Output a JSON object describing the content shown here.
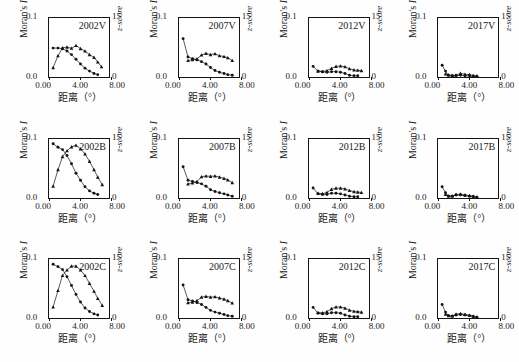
{
  "figure": {
    "title": "",
    "rows": 3,
    "cols": 4
  },
  "axes": {
    "y_left_title": "Moran's I",
    "y_left_title_plain": "Moran's ",
    "y_left_title_italic": "I",
    "y_left_max": "0.1",
    "y_left_min": "0.0",
    "y_right_title": "z-score",
    "y_right_max": "15",
    "y_right_min": "0",
    "x_title": "距离（°）",
    "x_ticks": [
      "0.00",
      "4.00",
      "8.00"
    ],
    "x_min": 0,
    "x_max": 8,
    "y_left_range": [
      0,
      0.1
    ],
    "y_right_range": [
      0,
      15
    ],
    "grid": false,
    "legend": "none",
    "marker_circle": "moran-i-filled-circle",
    "marker_triangle": "z-score-filled-triangle"
  },
  "chart_data": [
    {
      "type": "line",
      "title": "2002V",
      "xlabel": "距离（°）",
      "ylabel": "Moran's I",
      "y2label": "z-score",
      "xlim": [
        0,
        8
      ],
      "ylim": [
        0,
        0.1
      ],
      "y2lim": [
        0,
        15
      ],
      "grid": false,
      "series": [
        {
          "name": "Moran's I",
          "marker": "circle",
          "axis": "left",
          "x": [
            0.55,
            1.2,
            1.8,
            2.4,
            3.0,
            3.6,
            4.2,
            4.8,
            5.4,
            6.0,
            6.5
          ],
          "y": [
            0.049,
            0.049,
            0.048,
            0.044,
            0.038,
            0.03,
            0.022,
            0.015,
            0.01,
            0.006,
            0.004
          ]
        },
        {
          "name": "z-score",
          "marker": "triangle",
          "axis": "right",
          "x": [
            0.55,
            1.2,
            1.8,
            2.4,
            3.0,
            3.6,
            4.2,
            4.8,
            5.4,
            6.0,
            6.5,
            7.0
          ],
          "y": [
            2.4,
            5.4,
            7.4,
            7.6,
            7.3,
            8.0,
            7.2,
            6.6,
            5.7,
            5.0,
            3.8,
            2.6
          ]
        }
      ]
    },
    {
      "type": "line",
      "title": "2007V",
      "xlabel": "距离（°）",
      "ylabel": "Moran's I",
      "y2label": "z-score",
      "xlim": [
        0,
        8
      ],
      "ylim": [
        0,
        0.1
      ],
      "y2lim": [
        0,
        15
      ],
      "grid": false,
      "series": [
        {
          "name": "Moran's I",
          "marker": "circle",
          "axis": "left",
          "x": [
            0.55,
            1.2,
            1.8,
            2.4,
            3.0,
            3.6,
            4.2,
            4.8,
            5.4,
            6.0,
            6.5,
            7.1
          ],
          "y": [
            0.065,
            0.034,
            0.031,
            0.029,
            0.026,
            0.022,
            0.016,
            0.011,
            0.008,
            0.006,
            0.004,
            0.003
          ]
        },
        {
          "name": "z-score",
          "marker": "triangle",
          "axis": "right",
          "x": [
            1.2,
            1.8,
            2.4,
            3.0,
            3.6,
            4.2,
            4.8,
            5.4,
            6.0,
            6.5,
            7.1
          ],
          "y": [
            4.2,
            4.4,
            4.6,
            5.6,
            6.0,
            5.7,
            5.9,
            5.4,
            5.2,
            4.9,
            4.2
          ]
        }
      ]
    },
    {
      "type": "line",
      "title": "2012V",
      "xlabel": "距离（°）",
      "ylabel": "Moran's I",
      "y2label": "z-score",
      "xlim": [
        0,
        8
      ],
      "ylim": [
        0,
        0.1
      ],
      "y2lim": [
        0,
        15
      ],
      "grid": false,
      "series": [
        {
          "name": "Moran's I",
          "marker": "circle",
          "axis": "left",
          "x": [
            0.55,
            1.2,
            1.8,
            2.4,
            3.0,
            3.6,
            4.2,
            4.8,
            5.4,
            6.0,
            6.5
          ],
          "y": [
            0.018,
            0.01,
            0.009,
            0.008,
            0.009,
            0.009,
            0.008,
            0.006,
            0.003,
            0.002,
            0.002
          ]
        },
        {
          "name": "z-score",
          "marker": "triangle",
          "axis": "right",
          "x": [
            1.2,
            1.8,
            2.4,
            3.0,
            3.6,
            4.2,
            4.8,
            5.4,
            6.0,
            6.5,
            7.0
          ],
          "y": [
            1.5,
            1.4,
            1.6,
            2.2,
            2.7,
            2.8,
            2.6,
            2.1,
            1.8,
            1.7,
            1.6
          ]
        }
      ]
    },
    {
      "type": "line",
      "title": "2017V",
      "xlabel": "距离（°）",
      "ylabel": "Moran's I",
      "y2label": "z-score",
      "xlim": [
        0,
        8
      ],
      "ylim": [
        0,
        0.1
      ],
      "y2lim": [
        0,
        15
      ],
      "grid": false,
      "series": [
        {
          "name": "Moran's I",
          "marker": "circle",
          "axis": "left",
          "x": [
            0.55,
            1.0,
            1.4,
            1.9,
            2.4,
            3.0,
            3.6,
            4.2,
            4.7,
            5.2
          ],
          "y": [
            0.02,
            0.01,
            0.003,
            0.002,
            0.002,
            0.003,
            0.002,
            0.002,
            0.001,
            0.001
          ]
        },
        {
          "name": "z-score",
          "marker": "triangle",
          "axis": "right",
          "x": [
            1.0,
            1.4,
            1.9,
            2.4,
            3.0,
            3.6,
            4.2,
            4.7,
            5.2
          ],
          "y": [
            0.8,
            0.5,
            0.4,
            0.5,
            0.9,
            0.7,
            0.6,
            0.4,
            0.3
          ]
        }
      ]
    },
    {
      "type": "line",
      "title": "2002B",
      "xlabel": "距离（°）",
      "ylabel": "Moran's I",
      "y2label": "z-score",
      "xlim": [
        0,
        8
      ],
      "ylim": [
        0,
        0.1
      ],
      "y2lim": [
        0,
        15
      ],
      "grid": false,
      "series": [
        {
          "name": "Moran's I",
          "marker": "circle",
          "axis": "left",
          "x": [
            0.55,
            1.2,
            1.8,
            2.4,
            3.0,
            3.6,
            4.2,
            4.8,
            5.4,
            6.0,
            6.5
          ],
          "y": [
            0.092,
            0.086,
            0.082,
            0.072,
            0.058,
            0.042,
            0.03,
            0.019,
            0.012,
            0.008,
            0.006
          ]
        },
        {
          "name": "z-score",
          "marker": "triangle",
          "axis": "right",
          "x": [
            0.55,
            1.2,
            1.8,
            2.4,
            3.0,
            3.6,
            4.2,
            4.8,
            5.4,
            6.0,
            6.5,
            7.1
          ],
          "y": [
            3.0,
            7.2,
            10.5,
            12.0,
            13.0,
            13.4,
            12.5,
            11.2,
            9.3,
            7.2,
            5.3,
            3.4
          ]
        }
      ]
    },
    {
      "type": "line",
      "title": "2007B",
      "xlabel": "距离（°）",
      "ylabel": "Moran's I",
      "y2label": "z-score",
      "xlim": [
        0,
        8
      ],
      "ylim": [
        0,
        0.1
      ],
      "y2lim": [
        0,
        15
      ],
      "grid": false,
      "series": [
        {
          "name": "Moran's I",
          "marker": "circle",
          "axis": "left",
          "x": [
            0.55,
            1.2,
            1.8,
            2.4,
            3.0,
            3.6,
            4.2,
            4.8,
            5.4,
            6.0,
            6.5,
            7.1
          ],
          "y": [
            0.053,
            0.03,
            0.028,
            0.026,
            0.024,
            0.02,
            0.014,
            0.011,
            0.009,
            0.007,
            0.005,
            0.003
          ]
        },
        {
          "name": "z-score",
          "marker": "triangle",
          "axis": "right",
          "x": [
            1.2,
            1.8,
            2.4,
            3.0,
            3.6,
            4.2,
            4.8,
            5.4,
            6.0,
            6.5,
            7.1
          ],
          "y": [
            3.6,
            3.8,
            4.2,
            5.4,
            5.6,
            5.5,
            5.6,
            5.3,
            5.0,
            4.6,
            3.9
          ]
        }
      ]
    },
    {
      "type": "line",
      "title": "2012B",
      "xlabel": "距离（°）",
      "ylabel": "Moran's I",
      "y2label": "z-score",
      "xlim": [
        0,
        8
      ],
      "ylim": [
        0,
        0.1
      ],
      "y2lim": [
        0,
        15
      ],
      "grid": false,
      "series": [
        {
          "name": "Moran's I",
          "marker": "circle",
          "axis": "left",
          "x": [
            0.55,
            1.2,
            1.8,
            2.4,
            3.0,
            3.6,
            4.2,
            4.8,
            5.4,
            6.0,
            6.5
          ],
          "y": [
            0.017,
            0.007,
            0.006,
            0.006,
            0.008,
            0.008,
            0.007,
            0.005,
            0.003,
            0.002,
            0.002
          ]
        },
        {
          "name": "z-score",
          "marker": "triangle",
          "axis": "right",
          "x": [
            1.2,
            1.8,
            2.4,
            3.0,
            3.6,
            4.2,
            4.8,
            5.4,
            6.0,
            6.5,
            7.0
          ],
          "y": [
            1.2,
            1.1,
            1.4,
            2.2,
            2.5,
            2.5,
            2.3,
            1.9,
            1.6,
            1.5,
            1.4
          ]
        }
      ]
    },
    {
      "type": "line",
      "title": "2017B",
      "xlabel": "距离（°）",
      "ylabel": "Moran's I",
      "y2label": "z-score",
      "xlim": [
        0,
        8
      ],
      "ylim": [
        0,
        0.1
      ],
      "y2lim": [
        0,
        15
      ],
      "grid": false,
      "series": [
        {
          "name": "Moran's I",
          "marker": "circle",
          "axis": "left",
          "x": [
            0.55,
            1.0,
            1.4,
            1.9,
            2.4,
            3.0,
            3.6,
            4.2,
            4.7,
            5.2
          ],
          "y": [
            0.019,
            0.009,
            0.003,
            0.003,
            0.005,
            0.005,
            0.004,
            0.003,
            0.002,
            0.001
          ]
        },
        {
          "name": "z-score",
          "marker": "triangle",
          "axis": "right",
          "x": [
            1.0,
            1.4,
            1.9,
            2.4,
            3.0,
            3.6,
            4.2,
            4.7,
            5.2
          ],
          "y": [
            0.9,
            0.5,
            0.5,
            0.9,
            1.0,
            0.8,
            0.6,
            0.5,
            0.3
          ]
        }
      ]
    },
    {
      "type": "line",
      "title": "2002C",
      "xlabel": "距离（°）",
      "ylabel": "Moran's I",
      "y2label": "z-score",
      "xlim": [
        0,
        8
      ],
      "ylim": [
        0,
        0.1
      ],
      "y2lim": [
        0,
        15
      ],
      "grid": false,
      "series": [
        {
          "name": "Moran's I",
          "marker": "circle",
          "axis": "left",
          "x": [
            0.55,
            1.2,
            1.8,
            2.4,
            3.0,
            3.6,
            4.2,
            4.8,
            5.4,
            6.0,
            6.5
          ],
          "y": [
            0.091,
            0.087,
            0.082,
            0.07,
            0.055,
            0.04,
            0.027,
            0.017,
            0.011,
            0.007,
            0.005
          ]
        },
        {
          "name": "z-score",
          "marker": "triangle",
          "axis": "right",
          "x": [
            0.55,
            1.2,
            1.8,
            2.4,
            3.0,
            3.6,
            4.2,
            4.8,
            5.4,
            6.0,
            6.5,
            7.1
          ],
          "y": [
            2.8,
            7.0,
            10.8,
            12.2,
            13.2,
            13.2,
            12.2,
            10.8,
            8.8,
            6.8,
            5.0,
            3.2
          ]
        }
      ]
    },
    {
      "type": "line",
      "title": "2007C",
      "xlabel": "距离（°）",
      "ylabel": "Moran's I",
      "y2label": "z-score",
      "xlim": [
        0,
        8
      ],
      "ylim": [
        0,
        0.1
      ],
      "y2lim": [
        0,
        15
      ],
      "grid": false,
      "series": [
        {
          "name": "Moran's I",
          "marker": "circle",
          "axis": "left",
          "x": [
            0.55,
            1.2,
            1.8,
            2.4,
            3.0,
            3.6,
            4.2,
            4.8,
            5.4,
            6.0,
            6.5,
            7.1
          ],
          "y": [
            0.056,
            0.031,
            0.029,
            0.026,
            0.023,
            0.018,
            0.013,
            0.01,
            0.008,
            0.006,
            0.004,
            0.003
          ]
        },
        {
          "name": "z-score",
          "marker": "triangle",
          "axis": "right",
          "x": [
            1.2,
            1.8,
            2.4,
            3.0,
            3.6,
            4.2,
            4.8,
            5.4,
            6.0,
            6.5,
            7.1
          ],
          "y": [
            3.9,
            4.0,
            4.4,
            5.3,
            5.5,
            5.3,
            5.4,
            5.1,
            4.8,
            4.4,
            3.8
          ]
        }
      ]
    },
    {
      "type": "line",
      "title": "2012C",
      "xlabel": "距离（°）",
      "ylabel": "Moran's I",
      "y2label": "z-score",
      "xlim": [
        0,
        8
      ],
      "ylim": [
        0,
        0.1
      ],
      "y2lim": [
        0,
        15
      ],
      "grid": false,
      "series": [
        {
          "name": "Moran's I",
          "marker": "circle",
          "axis": "left",
          "x": [
            0.55,
            1.2,
            1.8,
            2.4,
            3.0,
            3.6,
            4.2,
            4.8,
            5.4,
            6.0,
            6.5
          ],
          "y": [
            0.018,
            0.008,
            0.007,
            0.007,
            0.009,
            0.009,
            0.008,
            0.005,
            0.003,
            0.002,
            0.002
          ]
        },
        {
          "name": "z-score",
          "marker": "triangle",
          "axis": "right",
          "x": [
            1.2,
            1.8,
            2.4,
            3.0,
            3.6,
            4.2,
            4.8,
            5.4,
            6.0,
            6.5,
            7.0
          ],
          "y": [
            1.4,
            1.3,
            1.6,
            2.4,
            2.8,
            2.8,
            2.5,
            2.0,
            1.7,
            1.6,
            1.5
          ]
        }
      ]
    },
    {
      "type": "line",
      "title": "2017C",
      "xlabel": "距离（°）",
      "ylabel": "Moran's I",
      "y2label": "z-score",
      "xlim": [
        0,
        8
      ],
      "ylim": [
        0,
        0.1
      ],
      "y2lim": [
        0,
        15
      ],
      "grid": false,
      "series": [
        {
          "name": "Moran's I",
          "marker": "circle",
          "axis": "left",
          "x": [
            0.55,
            1.0,
            1.4,
            1.9,
            2.4,
            3.0,
            3.6,
            4.2,
            4.7,
            5.2
          ],
          "y": [
            0.023,
            0.01,
            0.004,
            0.003,
            0.005,
            0.006,
            0.005,
            0.004,
            0.002,
            0.001
          ]
        },
        {
          "name": "z-score",
          "marker": "triangle",
          "axis": "right",
          "x": [
            1.0,
            1.4,
            1.9,
            2.4,
            3.0,
            3.6,
            4.2,
            4.7,
            5.2
          ],
          "y": [
            1.0,
            0.6,
            0.5,
            1.0,
            1.1,
            0.9,
            0.7,
            0.5,
            0.3
          ]
        }
      ]
    }
  ]
}
